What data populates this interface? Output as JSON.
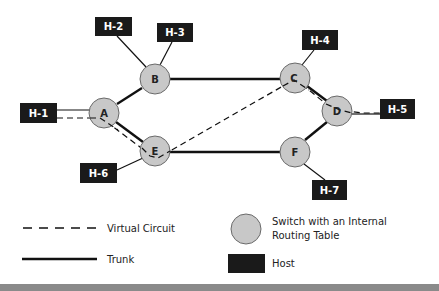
{
  "colors": {
    "switch_fill": "#c8c8c8",
    "switch_stroke": "#6a6a6a",
    "host_fill": "#1a1a1a",
    "line": "#111111",
    "bottom_bar": "#8a8a8a"
  },
  "switches": [
    {
      "id": "A",
      "label": "A",
      "cx": 104,
      "cy": 113
    },
    {
      "id": "B",
      "label": "B",
      "cx": 155,
      "cy": 79
    },
    {
      "id": "C",
      "label": "C",
      "cx": 295,
      "cy": 78
    },
    {
      "id": "D",
      "label": "D",
      "cx": 337,
      "cy": 111
    },
    {
      "id": "E",
      "label": "E",
      "cx": 155,
      "cy": 151
    },
    {
      "id": "F",
      "label": "F",
      "cx": 295,
      "cy": 152
    }
  ],
  "hosts": [
    {
      "id": "H-1",
      "label": "H-1",
      "x": 20,
      "y": 103
    },
    {
      "id": "H-2",
      "label": "H-2",
      "x": 95,
      "y": 17
    },
    {
      "id": "H-3",
      "label": "H-3",
      "x": 157,
      "y": 23
    },
    {
      "id": "H-4",
      "label": "H-4",
      "x": 302,
      "y": 30
    },
    {
      "id": "H-5",
      "label": "H-5",
      "x": 380,
      "y": 99
    },
    {
      "id": "H-6",
      "label": "H-6",
      "x": 80,
      "y": 163
    },
    {
      "id": "H-7",
      "label": "H-7",
      "x": 312,
      "y": 180
    }
  ],
  "trunks": [
    [
      "A",
      "B"
    ],
    [
      "B",
      "C"
    ],
    [
      "C",
      "D"
    ],
    [
      "A",
      "E"
    ],
    [
      "E",
      "F"
    ],
    [
      "F",
      "D"
    ]
  ],
  "access_links": [
    [
      "H-1",
      "A"
    ],
    [
      "H-2",
      "B"
    ],
    [
      "H-3",
      "B"
    ],
    [
      "H-4",
      "C"
    ],
    [
      "H-5",
      "D"
    ],
    [
      "H-6",
      "E"
    ],
    [
      "H-7",
      "F"
    ]
  ],
  "virtual_circuits": [
    {
      "name": "H-1 to H-5",
      "path": [
        "H-1",
        "A",
        "E",
        "C",
        "D",
        "H-5"
      ]
    }
  ],
  "legend": {
    "virtual_circuit": "Virtual Circuit",
    "trunk": "Trunk",
    "switch_line1": "Switch with an Internal",
    "switch_line2": "Routing Table",
    "host": "Host"
  }
}
